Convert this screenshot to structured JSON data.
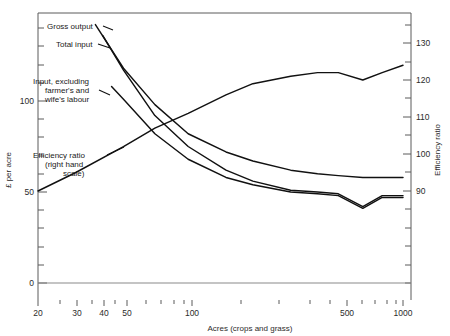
{
  "chart_data": {
    "type": "line",
    "title": "",
    "xlabel": "Acres (crops and grass)",
    "ylabel": "£ per acre",
    "y2label": "Efficiency ratio",
    "xscale": "log",
    "xlim": [
      20,
      1000
    ],
    "ylim": [
      0,
      130
    ],
    "y2lim": [
      55,
      137
    ],
    "xticks_labeled": [
      "20",
      "30",
      "40",
      "50",
      "100",
      "500",
      "1000"
    ],
    "xtick_values": [
      20,
      30,
      40,
      50,
      100,
      500,
      1000
    ],
    "yticks_labeled": [
      "0",
      "50",
      "100"
    ],
    "ytick_values": [
      0,
      50,
      100
    ],
    "y2ticks_labeled": [
      "90",
      "100",
      "110",
      "120",
      "130"
    ],
    "y2tick_values": [
      90,
      100,
      110,
      120,
      130
    ],
    "grid": false,
    "legend_position": "inline-annotations",
    "series": [
      {
        "name": "Gross output",
        "axis": "left",
        "units": "£ per acre",
        "x": [
          37,
          50,
          70,
          100,
          150,
          200,
          300,
          400,
          500,
          650,
          800,
          1000
        ],
        "values": [
          142,
          118,
          98,
          82,
          72,
          67,
          62,
          60,
          59,
          58,
          58,
          58
        ]
      },
      {
        "name": "Total input",
        "axis": "left",
        "units": "£ per acre",
        "x": [
          40,
          50,
          70,
          100,
          150,
          200,
          300,
          400,
          500,
          650,
          800,
          1000
        ],
        "values": [
          136,
          117,
          92,
          75,
          62,
          56,
          51,
          50,
          49,
          42,
          48,
          48
        ]
      },
      {
        "name": "Input, excluding farmer's and wife's labour",
        "axis": "left",
        "units": "£ per acre",
        "x": [
          44,
          50,
          70,
          100,
          150,
          200,
          300,
          400,
          500,
          650,
          800,
          1000
        ],
        "values": [
          108,
          101,
          82,
          68,
          58,
          54,
          50,
          49,
          48,
          41,
          47,
          47
        ]
      },
      {
        "name": "Efficiency ratio (right hand scale)",
        "axis": "right",
        "units": "ratio",
        "x": [
          20,
          30,
          50,
          70,
          100,
          150,
          200,
          300,
          400,
          500,
          650,
          800,
          1000
        ],
        "values": [
          90,
          95,
          102,
          107,
          111,
          116,
          119,
          121,
          122,
          122,
          120,
          122,
          124
        ]
      }
    ],
    "annotations": [
      {
        "text": "Gross output",
        "target_series": "Gross output"
      },
      {
        "text": "Total input",
        "target_series": "Total input"
      },
      {
        "text": "Input, excluding",
        "target_series": "Input, excluding farmer's and wife's labour"
      },
      {
        "text": "farmer's and",
        "target_series": "Input, excluding farmer's and wife's labour"
      },
      {
        "text": "wife's labour",
        "target_series": "Input, excluding farmer's and wife's labour"
      },
      {
        "text": "Efficiency ratio",
        "target_series": "Efficiency ratio (right hand scale)"
      },
      {
        "text": "(right hand",
        "target_series": "Efficiency ratio (right hand scale)"
      },
      {
        "text": "scale)",
        "target_series": "Efficiency ratio (right hand scale)"
      }
    ]
  },
  "axes": {
    "left_title": "£ per acre",
    "right_title": "Efficiency ratio",
    "bottom_title": "Acres (crops and grass)",
    "left_ticks": [
      "100",
      "50",
      "0"
    ],
    "right_ticks": [
      "130",
      "120",
      "110",
      "100",
      "90"
    ],
    "bottom_ticks": [
      "20",
      "30",
      "40",
      "50",
      "100",
      "500",
      "1000"
    ]
  },
  "labels": {
    "gross_output": "Gross output",
    "total_input": "Total input",
    "input_excl_1": "Input, excluding",
    "input_excl_2": "farmer's and",
    "input_excl_3": "wife's labour",
    "eff_1": "Efficiency ratio",
    "eff_2": "(right hand",
    "eff_3": "scale)"
  },
  "colors": {
    "curve": "#111111",
    "axis": "#5a5a5a",
    "background": "#ffffff",
    "text": "#1a1a1a"
  }
}
